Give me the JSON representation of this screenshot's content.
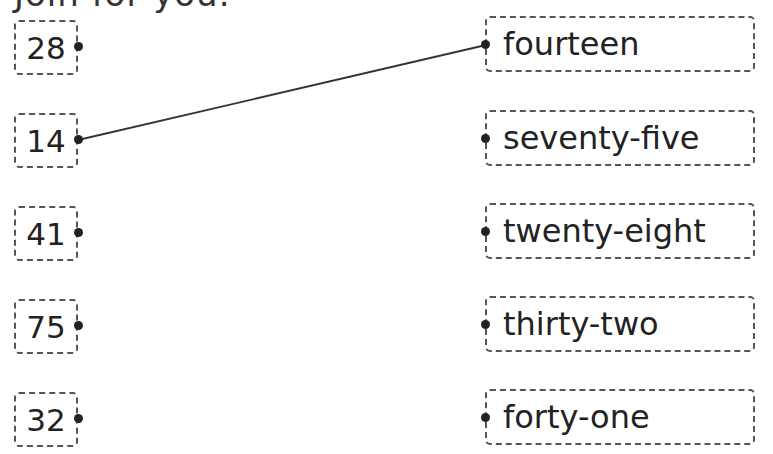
{
  "heading": "Join for you.",
  "numbers": [
    "28",
    "14",
    "41",
    "75",
    "32"
  ],
  "words": [
    "fourteen",
    "seventy-five",
    "twenty-eight",
    "thirty-two",
    "forty-one"
  ],
  "connections": [
    {
      "from_number": "14",
      "to_word": "fourteen"
    }
  ]
}
